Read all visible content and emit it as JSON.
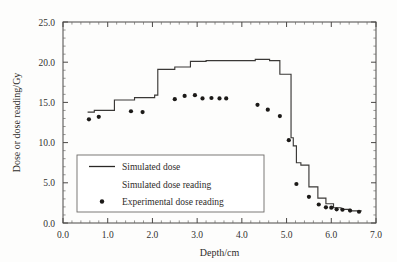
{
  "chart_data": {
    "type": "line",
    "title": "",
    "xlabel": "Depth/cm",
    "ylabel": "Dose or dose reading/Gy",
    "xlim": [
      0.0,
      7.0
    ],
    "ylim": [
      0.0,
      25.0
    ],
    "xticks": [
      "0.0",
      "1.0",
      "2.0",
      "3.0",
      "4.0",
      "5.0",
      "6.0",
      "7.0"
    ],
    "xtick_values": [
      0.0,
      1.0,
      2.0,
      3.0,
      4.0,
      5.0,
      6.0,
      7.0
    ],
    "yticks": [
      "0.0",
      "5.0",
      "10.0",
      "15.0",
      "20.0",
      "25.0"
    ],
    "ytick_values": [
      0.0,
      5.0,
      10.0,
      15.0,
      20.0,
      25.0
    ],
    "x_minor_per_major": 5,
    "y_minor_per_major": 5,
    "grid": false,
    "legend_position": "lower-left",
    "series": [
      {
        "name": "Simulated dose",
        "marker": "none",
        "style": "step",
        "color": "#3a3836",
        "x": [
          0.55,
          0.7,
          0.7,
          1.15,
          1.15,
          1.6,
          1.6,
          2.05,
          2.05,
          2.12,
          2.12,
          2.5,
          2.5,
          2.85,
          2.85,
          3.2,
          3.2,
          4.3,
          4.3,
          4.62,
          4.62,
          4.85,
          4.85,
          5.1,
          5.1,
          5.15,
          5.15,
          5.22,
          5.22,
          5.32,
          5.32,
          5.5,
          5.5,
          5.7,
          5.7,
          5.88,
          5.88,
          6.05,
          6.05,
          6.22,
          6.22,
          6.42,
          6.42,
          6.68
        ],
        "y": [
          13.8,
          13.8,
          14.0,
          14.0,
          15.3,
          15.3,
          15.6,
          15.6,
          15.9,
          15.9,
          19.1,
          19.1,
          19.4,
          19.4,
          20.1,
          20.1,
          20.2,
          20.2,
          20.35,
          20.35,
          20.2,
          20.2,
          18.5,
          18.5,
          10.6,
          10.6,
          9.6,
          9.6,
          7.5,
          7.5,
          7.2,
          7.2,
          4.5,
          4.5,
          3.1,
          3.1,
          2.4,
          2.4,
          1.9,
          1.9,
          1.7,
          1.7,
          1.5,
          1.5
        ]
      },
      {
        "name": "Simulated dose reading",
        "marker": "none",
        "style": "none",
        "color": "#3a3836",
        "x": [],
        "y": []
      },
      {
        "name": "Experimental dose reading",
        "marker": "dot",
        "style": "markers",
        "color": "#1c1a18",
        "x": [
          0.58,
          0.8,
          1.52,
          1.78,
          2.5,
          2.72,
          2.95,
          3.12,
          3.32,
          3.5,
          3.65,
          4.35,
          4.58,
          4.85,
          5.05,
          5.22,
          5.5,
          5.72,
          5.88,
          6.0,
          6.12,
          6.25,
          6.42,
          6.62
        ],
        "y": [
          12.9,
          13.2,
          13.9,
          13.8,
          15.4,
          15.8,
          15.9,
          15.5,
          15.55,
          15.5,
          15.5,
          14.7,
          14.1,
          13.3,
          10.3,
          4.85,
          3.25,
          2.3,
          1.95,
          1.9,
          1.7,
          1.65,
          1.55,
          1.4
        ]
      }
    ],
    "legend_entries": [
      {
        "label": "Simulated dose",
        "marker": "line"
      },
      {
        "label": "Simulated dose reading",
        "marker": "none"
      },
      {
        "label": "Experimental dose reading",
        "marker": "dot"
      }
    ]
  },
  "colors": {
    "line": "#3a3836",
    "marker": "#1c1a18",
    "axis": "#4a4846",
    "background": "#fdfdfc",
    "text": "#2e2c2a"
  }
}
